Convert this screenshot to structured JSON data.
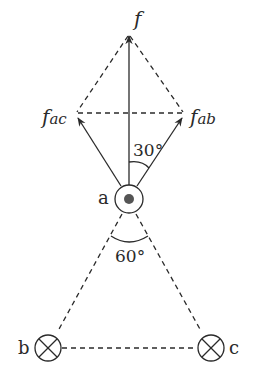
{
  "labels": {
    "f": "f",
    "f_ac_main": "f",
    "f_ac_sub": "ac",
    "f_ab_main": "f",
    "f_ab_sub": "ab",
    "angle_top": "30°",
    "angle_bottom": "60°",
    "a": "a",
    "b": "b",
    "c": "c"
  },
  "wires": {
    "a": "current out of page (dot)",
    "b": "current into page (cross)",
    "c": "current into page (cross)"
  },
  "colors": {
    "line": "#2a2a2a",
    "background": "#ffffff"
  }
}
